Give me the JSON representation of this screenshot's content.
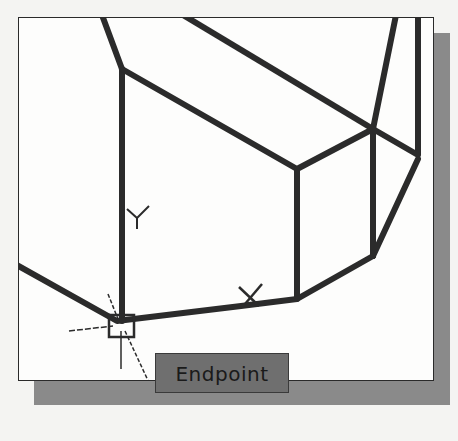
{
  "viewport": {
    "title": "Wireframe model viewport",
    "ucs_icon": {
      "x_label": "X",
      "y_label": "Y"
    }
  },
  "snap": {
    "marker": "endpoint-square",
    "tooltip_label": "Endpoint"
  },
  "colors": {
    "line": "#2b2b2b",
    "tooltip_bg": "#6f6f6f",
    "shadow": "#8a8a8a",
    "background": "#fdfdfc"
  }
}
